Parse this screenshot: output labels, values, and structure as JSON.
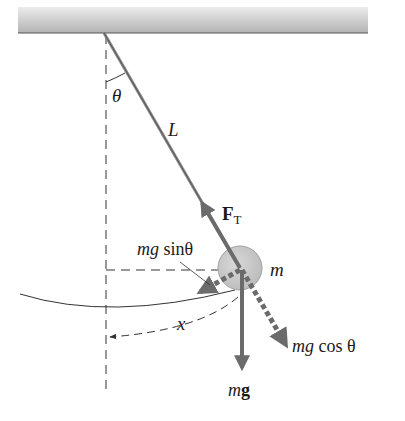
{
  "diagram": {
    "labels": {
      "theta": "θ",
      "length": "L",
      "tension": "F",
      "tension_sub": "T",
      "mass": "m",
      "mg_sin_prefix": "mg",
      "mg_sin_func": " sinθ",
      "mg_cos_prefix": "mg",
      "mg_cos_func": " cos θ",
      "weight_m": "m",
      "weight_g": "g",
      "displacement": "x"
    },
    "colors": {
      "ceiling_top": "#e6e6e6",
      "ceiling_bottom": "#b5b5b5",
      "vector": "#6b6b6b",
      "bob": "#c8c8c8",
      "line": "#333333"
    },
    "geometry": {
      "pivot": [
        104,
        33
      ],
      "bob_center": [
        240,
        268
      ],
      "bob_radius": 22
    }
  }
}
